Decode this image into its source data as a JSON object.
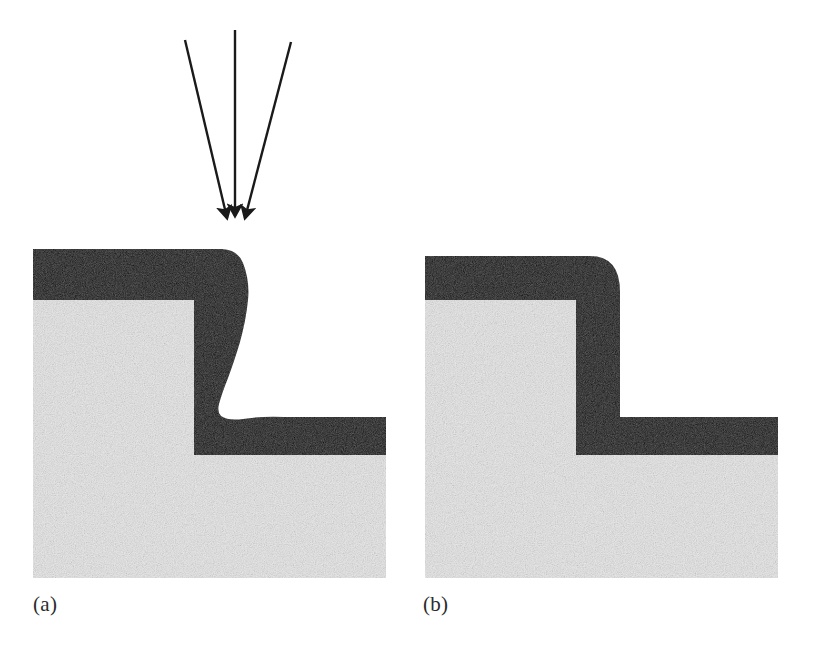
{
  "figure": {
    "domain": "scientific-diagram",
    "background_color": "#ffffff",
    "film_color": "#0d0d0d",
    "substrate_color": "#e9e9e9",
    "substrate_speckle_color": "#d2d2d2",
    "arrow_color": "#1a1a1a",
    "label_color": "#2b2b2b"
  },
  "panels": [
    {
      "id": "a",
      "label": "(a)",
      "label_x": 33,
      "label_y": 592,
      "coverage_type": "non-conformal",
      "description": "Directional deposition producing overhang cusp at the upper step corner, thinned film on the vertical sidewall and a re-entrant void notch at the base of the step.",
      "has_flux_arrows": true,
      "film_top_thickness_px": 51,
      "film_sidewall_min_thickness_px": 30,
      "film_bottom_thickness_px": 38
    },
    {
      "id": "b",
      "label": "(b)",
      "label_x": 423,
      "label_y": 592,
      "coverage_type": "conformal",
      "description": "Uniform conformal film of constant thickness following the step contour with a rounded outer corner and a square inner corner.",
      "has_flux_arrows": false,
      "film_top_thickness_px": 44,
      "film_sidewall_thickness_px": 44,
      "film_bottom_thickness_px": 38
    }
  ],
  "flux_arrows": {
    "count": 3,
    "meaning": "incident depositing-species flux",
    "converge_point_x": 235,
    "converge_point_y": 222,
    "arrows": [
      {
        "name": "left-flux-arrow",
        "x1": 185,
        "y1": 40,
        "x2": 227,
        "y2": 222
      },
      {
        "name": "center-flux-arrow",
        "x1": 235,
        "y1": 30,
        "x2": 235,
        "y2": 220
      },
      {
        "name": "right-flux-arrow",
        "x1": 291,
        "y1": 42,
        "x2": 245,
        "y2": 222
      }
    ]
  },
  "geometry": {
    "panel_a": {
      "substrate_left": 33,
      "substrate_right": 386,
      "upper_surface_y": 300,
      "lower_surface_y": 455,
      "substrate_bottom_y": 578,
      "step_edge_x": 194,
      "film_top_y": 249
    },
    "panel_b": {
      "substrate_left": 425,
      "substrate_right": 778,
      "upper_surface_y": 300,
      "lower_surface_y": 455,
      "substrate_bottom_y": 578,
      "step_edge_x": 576,
      "film_top_y": 256
    }
  }
}
